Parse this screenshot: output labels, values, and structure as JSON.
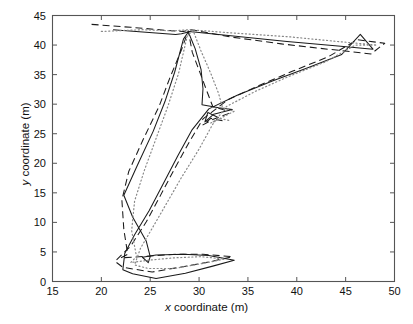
{
  "chart_data": {
    "type": "line",
    "title": "",
    "xlabel": "x coordinate (m)",
    "ylabel": "y coordinate (m)",
    "xlim": [
      15,
      50
    ],
    "ylim": [
      0,
      45
    ],
    "xticks": [
      15,
      20,
      25,
      30,
      35,
      40,
      45,
      50
    ],
    "yticks": [
      0,
      5,
      10,
      15,
      20,
      25,
      30,
      35,
      40,
      45
    ],
    "grid": false,
    "legend": "none",
    "axis_color": "#555555",
    "series": [
      {
        "name": "trajectory-solid",
        "style": "solid",
        "color": "#1a1a1a",
        "points": [
          [
            21.2,
            42.6
          ],
          [
            27.6,
            41.8
          ],
          [
            28.2,
            41.9
          ],
          [
            28.6,
            42.1
          ],
          [
            29.0,
            42.3
          ],
          [
            33.0,
            41.6
          ],
          [
            39.0,
            40.6
          ],
          [
            44.5,
            39.8
          ],
          [
            47.8,
            39.3
          ],
          [
            46.5,
            41.8
          ],
          [
            44.6,
            38.4
          ],
          [
            41.2,
            36.2
          ],
          [
            37.5,
            33.9
          ],
          [
            33.9,
            31.5
          ],
          [
            31.0,
            29.2
          ],
          [
            29.3,
            25.7
          ],
          [
            27.8,
            21.2
          ],
          [
            26.2,
            16.1
          ],
          [
            24.9,
            12.0
          ],
          [
            23.4,
            7.9
          ],
          [
            22.4,
            4.8
          ],
          [
            22.2,
            2.0
          ],
          [
            23.2,
            1.3
          ],
          [
            25.6,
            0.5
          ],
          [
            28.6,
            1.4
          ],
          [
            31.4,
            2.6
          ],
          [
            33.6,
            3.6
          ],
          [
            31.0,
            4.4
          ],
          [
            28.4,
            4.6
          ],
          [
            25.6,
            4.5
          ],
          [
            24.2,
            4.1
          ],
          [
            24.8,
            3.2
          ],
          [
            25.0,
            4.2
          ],
          [
            24.6,
            6.8
          ],
          [
            23.2,
            10.9
          ],
          [
            22.3,
            14.6
          ],
          [
            23.7,
            19.7
          ],
          [
            25.3,
            25.4
          ],
          [
            26.5,
            30.4
          ],
          [
            27.5,
            35.4
          ],
          [
            28.4,
            41.0
          ],
          [
            28.9,
            42.2
          ],
          [
            29.6,
            39.4
          ],
          [
            30.2,
            35.9
          ],
          [
            30.4,
            32.6
          ],
          [
            30.3,
            29.9
          ],
          [
            32.0,
            29.4
          ],
          [
            33.4,
            29.1
          ],
          [
            31.5,
            28.3
          ],
          [
            30.6,
            27.0
          ],
          [
            30.9,
            28.6
          ],
          [
            31.9,
            27.8
          ]
        ]
      },
      {
        "name": "trajectory-dashed",
        "style": "dashed",
        "color": "#1a1a1a",
        "points": [
          [
            19.0,
            43.5
          ],
          [
            23.0,
            43.0
          ],
          [
            26.6,
            42.5
          ],
          [
            28.4,
            42.3
          ],
          [
            29.2,
            42.6
          ],
          [
            33.5,
            41.3
          ],
          [
            38.4,
            40.2
          ],
          [
            43.2,
            39.3
          ],
          [
            47.6,
            38.5
          ],
          [
            49.0,
            40.3
          ],
          [
            46.2,
            40.9
          ],
          [
            43.2,
            38.0
          ],
          [
            39.6,
            35.6
          ],
          [
            36.2,
            33.2
          ],
          [
            33.0,
            30.8
          ],
          [
            30.4,
            27.5
          ],
          [
            29.0,
            23.6
          ],
          [
            27.5,
            19.1
          ],
          [
            26.0,
            14.4
          ],
          [
            24.6,
            10.1
          ],
          [
            23.0,
            6.0
          ],
          [
            21.4,
            3.4
          ],
          [
            22.2,
            2.4
          ],
          [
            25.2,
            1.6
          ],
          [
            28.0,
            2.4
          ],
          [
            31.0,
            3.3
          ],
          [
            33.4,
            4.2
          ],
          [
            30.4,
            4.6
          ],
          [
            27.6,
            4.6
          ],
          [
            25.0,
            4.3
          ],
          [
            22.0,
            4.0
          ],
          [
            22.7,
            4.6
          ],
          [
            22.3,
            8.8
          ],
          [
            22.1,
            13.8
          ],
          [
            22.8,
            18.6
          ],
          [
            24.3,
            24.1
          ],
          [
            25.9,
            29.6
          ],
          [
            27.0,
            34.4
          ],
          [
            28.2,
            39.2
          ],
          [
            28.9,
            42.4
          ],
          [
            29.3,
            38.8
          ],
          [
            30.1,
            35.3
          ],
          [
            30.8,
            32.2
          ],
          [
            31.4,
            29.6
          ],
          [
            32.6,
            29.0
          ],
          [
            33.0,
            28.4
          ],
          [
            31.4,
            27.4
          ],
          [
            30.4,
            26.5
          ],
          [
            31.2,
            27.6
          ],
          [
            32.4,
            27.2
          ]
        ]
      },
      {
        "name": "trajectory-dotted",
        "style": "dotted",
        "color": "#888888",
        "points": [
          [
            20.0,
            42.3
          ],
          [
            24.2,
            42.6
          ],
          [
            27.4,
            42.4
          ],
          [
            29.0,
            42.6
          ],
          [
            33.8,
            42.0
          ],
          [
            39.2,
            41.4
          ],
          [
            44.2,
            40.6
          ],
          [
            48.2,
            40.0
          ],
          [
            46.0,
            40.0
          ],
          [
            43.0,
            37.2
          ],
          [
            39.2,
            34.7
          ],
          [
            35.8,
            32.2
          ],
          [
            32.8,
            29.6
          ],
          [
            31.4,
            26.6
          ],
          [
            30.0,
            22.4
          ],
          [
            28.2,
            17.6
          ],
          [
            26.6,
            13.0
          ],
          [
            25.2,
            9.0
          ],
          [
            24.0,
            5.6
          ],
          [
            23.4,
            2.8
          ],
          [
            24.8,
            2.2
          ],
          [
            27.4,
            2.2
          ],
          [
            30.2,
            3.0
          ],
          [
            32.6,
            3.8
          ],
          [
            30.2,
            4.2
          ],
          [
            27.4,
            4.0
          ],
          [
            24.8,
            3.6
          ],
          [
            23.0,
            3.2
          ],
          [
            23.6,
            4.2
          ],
          [
            23.1,
            8.6
          ],
          [
            23.4,
            13.6
          ],
          [
            24.4,
            18.8
          ],
          [
            25.6,
            24.2
          ],
          [
            26.8,
            29.6
          ],
          [
            27.9,
            35.2
          ],
          [
            28.8,
            41.6
          ],
          [
            29.4,
            42.4
          ],
          [
            30.2,
            39.0
          ],
          [
            31.2,
            35.2
          ],
          [
            32.0,
            31.8
          ],
          [
            32.4,
            29.4
          ],
          [
            33.6,
            28.8
          ],
          [
            32.4,
            27.8
          ],
          [
            31.2,
            26.8
          ],
          [
            32.0,
            27.6
          ],
          [
            33.2,
            27.2
          ]
        ]
      }
    ]
  },
  "axes": {
    "xtick_labels": [
      "15",
      "20",
      "25",
      "30",
      "35",
      "40",
      "45",
      "50"
    ],
    "ytick_labels": [
      "0",
      "5",
      "10",
      "15",
      "20",
      "25",
      "30",
      "35",
      "40",
      "45"
    ],
    "xlabel_italic": "x",
    "xlabel_rest": " coordinate (m)",
    "ylabel_italic": "y",
    "ylabel_rest": " coordinate (m)"
  }
}
